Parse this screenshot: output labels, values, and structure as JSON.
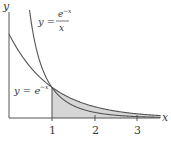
{
  "chart_data": {
    "type": "area",
    "title": "",
    "xlabel": "x",
    "ylabel": "y",
    "x_ticks": [
      "1",
      "2",
      "3"
    ],
    "xlim": [
      0,
      3.7
    ],
    "ylim": [
      0,
      1.4
    ],
    "grid": false,
    "series": [
      {
        "name": "y = e^{-x}",
        "function": "exp(-x)",
        "label_text": "y = e⁻ˣ"
      },
      {
        "name": "y = e^{-x}/x",
        "function": "exp(-x)/x",
        "label_text": "y ="
      }
    ],
    "shaded_region": {
      "under": "e^{-x}",
      "from_x": 1,
      "to_x": "infinity",
      "color": "#d4d4d4"
    },
    "annotations": [
      {
        "text": "y = e^{-x}/x",
        "position": "upper middle"
      },
      {
        "text": "y = e^{-x}",
        "position": "left at x=1"
      }
    ]
  },
  "labels": {
    "y_axis": "y",
    "x_axis": "x",
    "tick1": "1",
    "tick2": "2",
    "tick3": "3",
    "curve2_prefix": "y =",
    "curve2_num": "e",
    "curve2_num_exp": "−x",
    "curve2_den": "x",
    "curve1_prefix": "y = e",
    "curve1_exp": "−x"
  },
  "colors": {
    "axis": "#555555",
    "curve": "#555555",
    "shade": "#d6d6d6"
  }
}
